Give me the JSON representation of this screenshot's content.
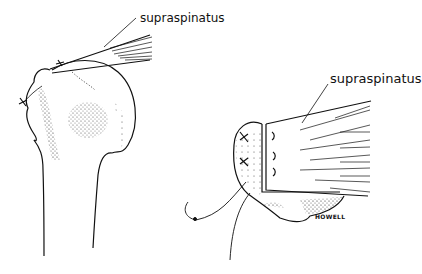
{
  "figure": {
    "panels": [
      {
        "id": "left",
        "subject": "humerus head with supraspinatus tendon attached by sutures",
        "label": "supraspinatus"
      },
      {
        "id": "right",
        "subject": "supraspinatus tendon advanced into bone trough with sutures",
        "label": "supraspinatus"
      }
    ],
    "signature": "HOWELL",
    "colors": {
      "ink": "#111111",
      "background": "#ffffff"
    }
  }
}
